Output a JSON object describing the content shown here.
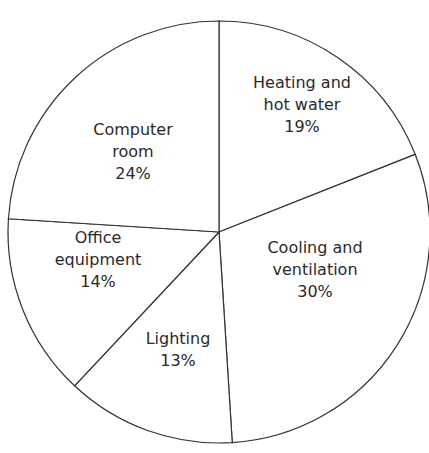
{
  "title": "",
  "chart_data": {
    "type": "pie",
    "title": "",
    "categories": [
      "Heating and hot water",
      "Cooling and ventilation",
      "Lighting",
      "Office equipment",
      "Computer room"
    ],
    "values": [
      19,
      30,
      13,
      14,
      24
    ],
    "unit": "%",
    "labels": [
      {
        "lines": [
          "Heating and",
          "hot water",
          "19%"
        ],
        "x": 302,
        "y": 110
      },
      {
        "lines": [
          "Cooling and",
          "ventilation",
          "30%"
        ],
        "x": 315,
        "y": 275
      },
      {
        "lines": [
          "Lighting",
          "13%"
        ],
        "x": 178,
        "y": 355
      },
      {
        "lines": [
          "Office",
          "equipment",
          "14%"
        ],
        "x": 98,
        "y": 265
      },
      {
        "lines": [
          "Computer",
          "room",
          "24%"
        ],
        "x": 133,
        "y": 157
      }
    ],
    "start_angle_deg": -90,
    "direction": "clockwise",
    "center": [
      219,
      232
    ],
    "radius": 211,
    "colors": {
      "fill": "#ffffff",
      "stroke": "#333333",
      "text": "#2a2a2a"
    },
    "legend": "none",
    "grid": false
  }
}
